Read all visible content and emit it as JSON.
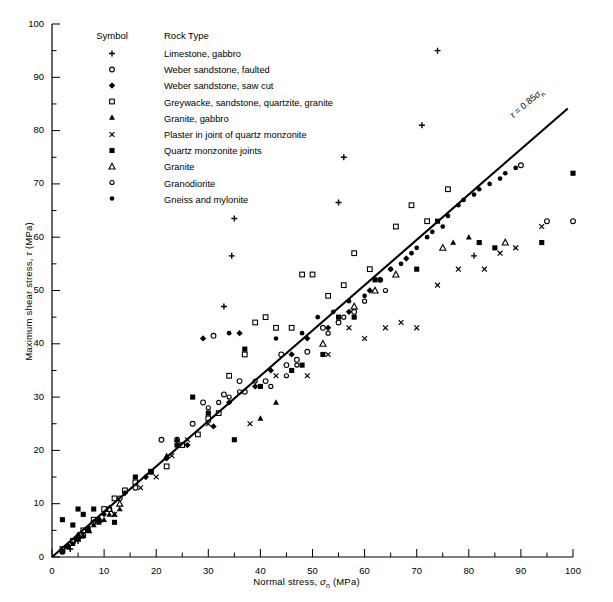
{
  "chart_data": {
    "type": "scatter",
    "title": "",
    "xlabel": "Normal stress, σₙ (MPa)",
    "ylabel": "Maximum shear stress, τ (MPa)",
    "xlim": [
      0,
      100
    ],
    "ylim": [
      0,
      100
    ],
    "xticks": [
      0,
      10,
      20,
      30,
      40,
      50,
      60,
      70,
      80,
      90,
      100
    ],
    "yticks": [
      0,
      10,
      20,
      30,
      40,
      50,
      60,
      70,
      80,
      90,
      100
    ],
    "minor_tick_step": 5,
    "grid": false,
    "legend_position": "upper-left-inside",
    "legend_headers": {
      "symbol": "Symbol",
      "rock_type": "Rock Type"
    },
    "annotations": [
      {
        "text": "τ = 0.85σₙ",
        "x": 93,
        "y": 82,
        "rotation": -40
      }
    ],
    "fit_line": {
      "label": "τ = 0.85σₙ",
      "slope": 0.85,
      "intercept": 0,
      "x_start": 0,
      "x_end": 99
    },
    "series": [
      {
        "name": "Limestone, gabbro",
        "marker": "plus",
        "points": [
          [
            3.5,
            1.5
          ],
          [
            5,
            3
          ],
          [
            33,
            47
          ],
          [
            34.5,
            56.5
          ],
          [
            35,
            63.5
          ],
          [
            55,
            66.5
          ],
          [
            56,
            75
          ],
          [
            71,
            81
          ],
          [
            74,
            95
          ],
          [
            81,
            56.5
          ]
        ]
      },
      {
        "name": "Weber sandstone, faulted",
        "marker": "open-circle",
        "points": [
          [
            2,
            1
          ],
          [
            3,
            2
          ],
          [
            4,
            3
          ],
          [
            6,
            4
          ],
          [
            8,
            6.5
          ],
          [
            11,
            9
          ],
          [
            13,
            11
          ],
          [
            16,
            13
          ],
          [
            21,
            22
          ],
          [
            24,
            22
          ],
          [
            27,
            25
          ],
          [
            29,
            29
          ],
          [
            31,
            41.5
          ],
          [
            33,
            30.5
          ],
          [
            36,
            33
          ],
          [
            37,
            31
          ],
          [
            41,
            33
          ],
          [
            44,
            38
          ],
          [
            45,
            36
          ],
          [
            47,
            37
          ],
          [
            49,
            38.5
          ],
          [
            52,
            43
          ],
          [
            55,
            44
          ],
          [
            58,
            46
          ],
          [
            63,
            52
          ],
          [
            90,
            73.5
          ],
          [
            95,
            63
          ],
          [
            100,
            63
          ]
        ]
      },
      {
        "name": "Weber sandstone, saw cut",
        "marker": "filled-diamond",
        "points": [
          [
            3,
            2
          ],
          [
            5,
            3.5
          ],
          [
            9,
            7
          ],
          [
            14,
            12
          ],
          [
            18,
            15
          ],
          [
            22,
            18.5
          ],
          [
            26,
            21
          ],
          [
            29,
            41
          ],
          [
            31,
            24.5
          ],
          [
            34,
            29
          ],
          [
            36,
            42
          ],
          [
            39,
            32
          ],
          [
            42,
            35
          ],
          [
            46,
            38
          ],
          [
            49,
            41
          ],
          [
            53,
            43
          ],
          [
            57,
            46
          ],
          [
            61,
            50
          ],
          [
            65,
            54
          ],
          [
            68,
            56
          ]
        ]
      },
      {
        "name": "Greywacke, sandstone, quartzite, granite",
        "marker": "open-square",
        "points": [
          [
            2,
            1.5
          ],
          [
            4,
            3
          ],
          [
            6,
            5
          ],
          [
            8,
            7
          ],
          [
            10,
            9
          ],
          [
            12,
            11
          ],
          [
            14,
            12.5
          ],
          [
            16,
            14
          ],
          [
            19,
            16
          ],
          [
            22,
            17
          ],
          [
            25,
            21
          ],
          [
            28,
            23
          ],
          [
            30,
            26
          ],
          [
            32,
            27
          ],
          [
            34,
            34
          ],
          [
            37,
            38
          ],
          [
            39,
            44
          ],
          [
            41,
            45
          ],
          [
            43,
            43
          ],
          [
            46,
            43
          ],
          [
            48,
            53
          ],
          [
            50,
            53
          ],
          [
            53,
            49
          ],
          [
            56,
            51
          ],
          [
            58,
            57
          ],
          [
            61,
            54
          ],
          [
            66,
            62
          ],
          [
            69,
            66
          ],
          [
            72,
            63
          ],
          [
            76,
            69
          ]
        ]
      },
      {
        "name": "Granite, gabbro",
        "marker": "filled-triangle",
        "points": [
          [
            2,
            1
          ],
          [
            3,
            2
          ],
          [
            4,
            2.5
          ],
          [
            5,
            3.5
          ],
          [
            6,
            4
          ],
          [
            7,
            5
          ],
          [
            8,
            6
          ],
          [
            9,
            6.5
          ],
          [
            10,
            7
          ],
          [
            11,
            8
          ],
          [
            12,
            8
          ],
          [
            13,
            9
          ],
          [
            22,
            19
          ],
          [
            24,
            22
          ],
          [
            40,
            26
          ],
          [
            43,
            29
          ],
          [
            77,
            59
          ],
          [
            80,
            60
          ]
        ]
      },
      {
        "name": "Plaster in joint of quartz monzonite",
        "marker": "cross",
        "points": [
          [
            12,
            8
          ],
          [
            17,
            13
          ],
          [
            20,
            15
          ],
          [
            23,
            19
          ],
          [
            26,
            22
          ],
          [
            30,
            25
          ],
          [
            38,
            25
          ],
          [
            43,
            34
          ],
          [
            49,
            34
          ],
          [
            53,
            38
          ],
          [
            57,
            43
          ],
          [
            60,
            41
          ],
          [
            64,
            43
          ],
          [
            67,
            44
          ],
          [
            70,
            43
          ],
          [
            74,
            51
          ],
          [
            78,
            54
          ],
          [
            83,
            54
          ],
          [
            86,
            57
          ],
          [
            89,
            58
          ],
          [
            94,
            62
          ]
        ]
      },
      {
        "name": "Quartz monzonite joints",
        "marker": "filled-square",
        "points": [
          [
            2,
            7
          ],
          [
            4,
            6
          ],
          [
            5,
            9
          ],
          [
            6,
            8
          ],
          [
            8,
            9
          ],
          [
            12,
            6.5
          ],
          [
            16,
            15
          ],
          [
            19,
            16
          ],
          [
            24,
            21
          ],
          [
            27,
            30
          ],
          [
            30,
            27
          ],
          [
            35,
            22
          ],
          [
            37,
            39
          ],
          [
            40,
            32
          ],
          [
            46,
            35
          ],
          [
            48,
            36
          ],
          [
            52,
            38
          ],
          [
            55,
            45
          ],
          [
            58,
            45
          ],
          [
            62,
            52
          ],
          [
            70,
            54
          ],
          [
            74,
            63
          ],
          [
            82,
            59
          ],
          [
            85,
            58
          ],
          [
            94,
            59
          ],
          [
            100,
            72
          ]
        ]
      },
      {
        "name": "Granite",
        "marker": "open-triangle",
        "points": [
          [
            3,
            2
          ],
          [
            5,
            4
          ],
          [
            7,
            5
          ],
          [
            9,
            7
          ],
          [
            11,
            9
          ],
          [
            13,
            10
          ],
          [
            52,
            40
          ],
          [
            58,
            47
          ],
          [
            62,
            50
          ],
          [
            66,
            53
          ],
          [
            75,
            58
          ],
          [
            87,
            59
          ]
        ]
      },
      {
        "name": "Granodiorite",
        "marker": "open-circle-small",
        "points": [
          [
            2,
            1
          ],
          [
            3,
            2
          ],
          [
            4,
            3
          ],
          [
            5,
            3.5
          ],
          [
            7,
            5
          ],
          [
            9,
            7
          ],
          [
            30,
            28
          ],
          [
            32,
            29
          ],
          [
            34,
            30
          ],
          [
            36,
            31
          ],
          [
            39,
            33
          ],
          [
            42,
            32
          ],
          [
            45,
            34
          ],
          [
            47,
            36
          ],
          [
            53,
            42
          ],
          [
            56,
            45
          ],
          [
            60,
            48
          ],
          [
            64,
            50
          ]
        ]
      },
      {
        "name": "Gneiss and mylonite",
        "marker": "filled-circle",
        "points": [
          [
            3,
            2
          ],
          [
            5,
            4
          ],
          [
            7,
            5.5
          ],
          [
            10,
            8
          ],
          [
            34,
            42
          ],
          [
            43,
            41
          ],
          [
            48,
            42
          ],
          [
            51,
            45
          ],
          [
            54,
            46
          ],
          [
            57,
            48
          ],
          [
            60,
            49
          ],
          [
            63,
            52
          ],
          [
            65,
            54
          ],
          [
            67,
            55
          ],
          [
            69,
            57
          ],
          [
            70,
            58
          ],
          [
            72,
            60
          ],
          [
            73,
            61
          ],
          [
            75,
            62
          ],
          [
            76,
            64
          ],
          [
            78,
            66
          ],
          [
            79,
            67
          ],
          [
            81,
            68
          ],
          [
            82,
            69
          ],
          [
            84,
            70
          ],
          [
            86,
            71
          ],
          [
            87,
            72
          ],
          [
            89,
            73
          ]
        ]
      }
    ]
  }
}
